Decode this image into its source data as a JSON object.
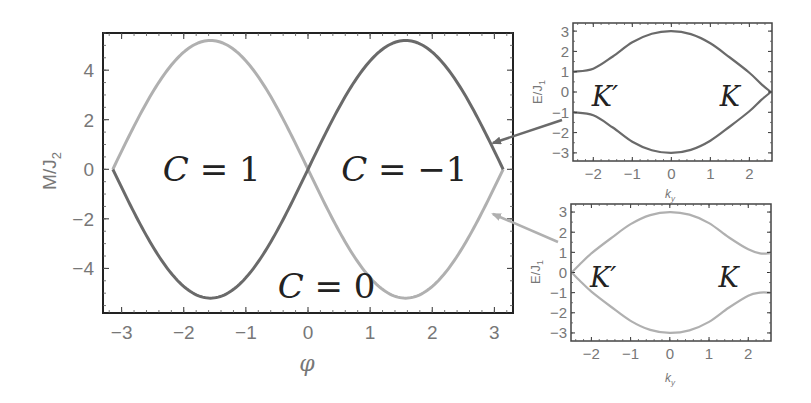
{
  "chart_data": [
    {
      "id": "main",
      "type": "line",
      "title": "",
      "xlabel": "φ",
      "ylabel": "M/J₂",
      "xlim": [
        -3.3,
        3.3
      ],
      "ylim": [
        -5.8,
        5.5
      ],
      "xticks": [
        -3,
        -2,
        -1,
        0,
        1,
        2,
        3
      ],
      "yticks": [
        -4,
        -2,
        0,
        2,
        4
      ],
      "grid": false,
      "series": [
        {
          "name": "M = 3√3·sin φ",
          "color": "#6a6a6a",
          "amplitude": 5.2,
          "x_range": [
            -3.1416,
            3.1416
          ]
        },
        {
          "name": "M = −3√3·sin φ",
          "color": "#b0b0b0",
          "amplitude": -5.2,
          "x_range": [
            -3.1416,
            3.1416
          ]
        }
      ],
      "annotations": [
        {
          "text_script": "C",
          "text_rest": " = 1",
          "x": -1.55,
          "y": 0.0
        },
        {
          "text_script": "C",
          "text_rest": " = −1",
          "x": 1.55,
          "y": 0.0
        },
        {
          "text_script": "C",
          "text_rest": " = 0",
          "x": 0.3,
          "y": -4.7
        }
      ]
    },
    {
      "id": "inset-top",
      "type": "line",
      "xlabel": "k_y",
      "ylabel": "E/J₁",
      "xlim": [
        -2.52,
        2.58
      ],
      "ylim": [
        -3.4,
        3.4
      ],
      "xticks": [
        -2,
        -1,
        0,
        1,
        2
      ],
      "yticks": [
        -3,
        -2,
        -1,
        0,
        1,
        2,
        3
      ],
      "color": "#6a6a6a",
      "series": [
        {
          "name": "upper band",
          "points": [
            [
              -2.5,
              1.0
            ],
            [
              -2.0,
              1.15
            ],
            [
              -1.5,
              1.75
            ],
            [
              -1.0,
              2.45
            ],
            [
              -0.5,
              2.87
            ],
            [
              0,
              3.0
            ],
            [
              0.5,
              2.85
            ],
            [
              1.0,
              2.4
            ],
            [
              1.5,
              1.7
            ],
            [
              2.0,
              0.95
            ],
            [
              2.3,
              0.4
            ],
            [
              2.55,
              0.0
            ]
          ]
        },
        {
          "name": "lower band",
          "points": [
            [
              -2.5,
              -1.0
            ],
            [
              -2.0,
              -1.15
            ],
            [
              -1.5,
              -1.75
            ],
            [
              -1.0,
              -2.45
            ],
            [
              -0.5,
              -2.87
            ],
            [
              0,
              -3.0
            ],
            [
              0.5,
              -2.85
            ],
            [
              1.0,
              -2.4
            ],
            [
              1.5,
              -1.7
            ],
            [
              2.0,
              -0.95
            ],
            [
              2.3,
              -0.4
            ],
            [
              2.55,
              0.0
            ]
          ]
        }
      ],
      "annotations": [
        {
          "text": "K′",
          "x": -1.7,
          "y": -0.2
        },
        {
          "text": "K",
          "x": 1.5,
          "y": -0.2
        }
      ]
    },
    {
      "id": "inset-bottom",
      "type": "line",
      "xlabel": "k_y",
      "ylabel": "E/J₁",
      "xlim": [
        -2.52,
        2.58
      ],
      "ylim": [
        -3.4,
        3.4
      ],
      "xticks": [
        -2,
        -1,
        0,
        1,
        2
      ],
      "yticks": [
        -3,
        -2,
        -1,
        0,
        1,
        2,
        3
      ],
      "color": "#b0b0b0",
      "series": [
        {
          "name": "upper band",
          "points": [
            [
              -2.5,
              0.0
            ],
            [
              -2.3,
              0.4
            ],
            [
              -2.0,
              0.95
            ],
            [
              -1.5,
              1.7
            ],
            [
              -1.0,
              2.4
            ],
            [
              -0.5,
              2.85
            ],
            [
              0,
              3.0
            ],
            [
              0.5,
              2.87
            ],
            [
              1.0,
              2.45
            ],
            [
              1.5,
              1.75
            ],
            [
              2.0,
              1.15
            ],
            [
              2.3,
              0.95
            ],
            [
              2.55,
              0.95
            ]
          ]
        },
        {
          "name": "lower band",
          "points": [
            [
              -2.5,
              0.0
            ],
            [
              -2.3,
              -0.4
            ],
            [
              -2.0,
              -0.95
            ],
            [
              -1.5,
              -1.7
            ],
            [
              -1.0,
              -2.4
            ],
            [
              -0.5,
              -2.85
            ],
            [
              0,
              -3.0
            ],
            [
              0.5,
              -2.87
            ],
            [
              1.0,
              -2.45
            ],
            [
              1.5,
              -1.75
            ],
            [
              2.0,
              -1.15
            ],
            [
              2.3,
              -1.0
            ],
            [
              2.55,
              -1.0
            ]
          ]
        }
      ],
      "annotations": [
        {
          "text": "K′",
          "x": -1.7,
          "y": -0.2
        },
        {
          "text": "K",
          "x": 1.5,
          "y": -0.2
        }
      ]
    }
  ],
  "labels": {
    "main_xlabel": "φ",
    "main_ylabel_M": "M/J",
    "main_ylabel_sub": "2",
    "inset_xlabel_k": "k",
    "inset_xlabel_sub": "y",
    "inset_ylabel_E": "E/J",
    "inset_ylabel_sub": "1"
  },
  "arrows": [
    {
      "from": [
        562,
        120
      ],
      "to": [
        493,
        143
      ],
      "color": "#6a6a6a"
    },
    {
      "from": [
        558,
        242
      ],
      "to": [
        493,
        214
      ],
      "color": "#b0b0b0"
    }
  ]
}
